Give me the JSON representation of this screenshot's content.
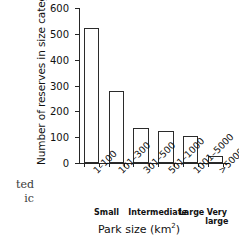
{
  "page_margin_text": {
    "line1": "ted",
    "line2": "ic"
  },
  "chart_data": {
    "type": "bar",
    "title": "",
    "xlabel": "Park size (km²)",
    "ylabel": "Number of reserves in size category",
    "categories": [
      "1–100",
      "101–300",
      "301–500",
      "501–1000",
      "1001–5000",
      ">5000"
    ],
    "values": [
      521,
      278,
      135,
      123,
      103,
      27
    ],
    "ylim": [
      0,
      600
    ],
    "yticks": [
      0,
      100,
      200,
      300,
      400,
      500,
      600
    ],
    "ytick_labels": [
      "0",
      "100",
      "200",
      "300",
      "400",
      "500",
      "600"
    ],
    "grid": false,
    "legend": null,
    "bar_style": {
      "fill": "#ffffff",
      "edge": "#2b2b2b"
    },
    "group_labels": [
      {
        "text": "Small",
        "spans_categories": [
          0,
          1
        ],
        "center_fraction": 0.185
      },
      {
        "text": "Intermediate",
        "spans_categories": [
          2,
          3
        ],
        "center_fraction": 0.505
      },
      {
        "text": "Large",
        "spans_categories": [
          4
        ],
        "center_fraction": 0.755
      },
      {
        "text": "Very large",
        "spans_categories": [
          5
        ],
        "center_fraction": 0.925
      }
    ]
  }
}
